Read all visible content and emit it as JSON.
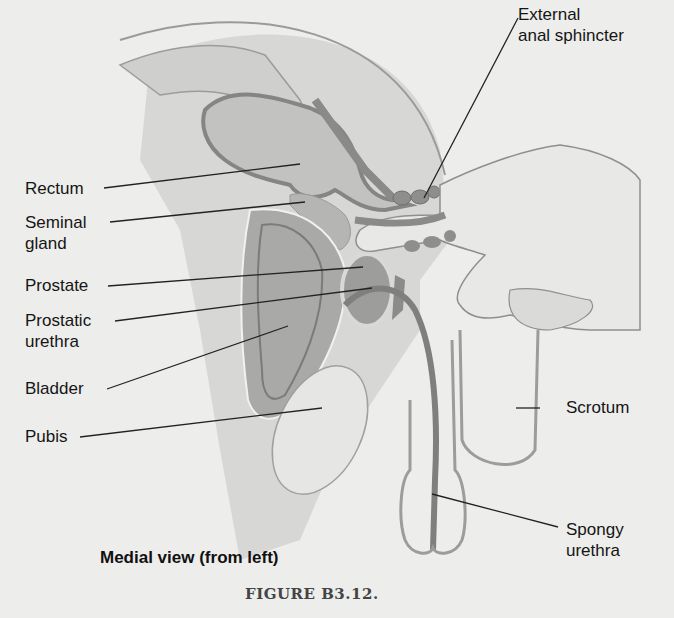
{
  "figure": {
    "title": "Medial view (from left)",
    "caption": "FIGURE B3.12.",
    "labels": {
      "external_anal_sphincter": [
        "External",
        "anal sphincter"
      ],
      "rectum": [
        "Rectum"
      ],
      "seminal_gland": [
        "Seminal",
        "gland"
      ],
      "prostate": [
        "Prostate"
      ],
      "prostatic_urethra": [
        "Prostatic",
        "urethra"
      ],
      "bladder": [
        "Bladder"
      ],
      "pubis": [
        "Pubis"
      ],
      "scrotum": [
        "Scrotum"
      ],
      "spongy_urethra": [
        "Spongy",
        "urethra"
      ]
    }
  },
  "colors": {
    "background": "#ededeb",
    "tissue_light": "#d9d9d7",
    "organ_mid": "#b3b3b1",
    "organ_dark": "#8e8e8c",
    "outline": "#7d7d7b",
    "leader_line": "#222222"
  }
}
